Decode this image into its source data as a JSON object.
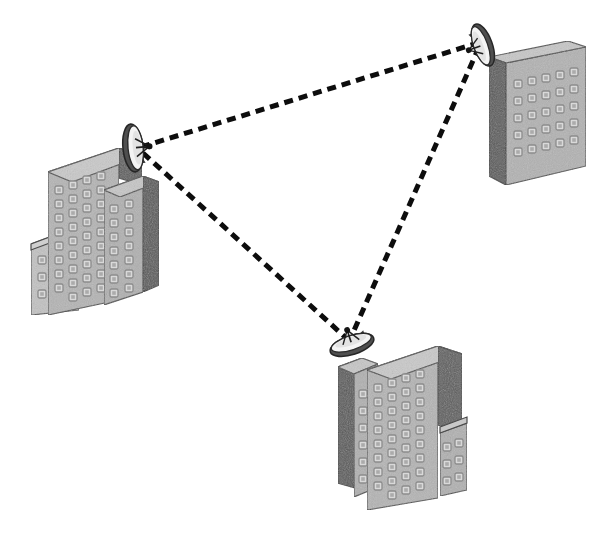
{
  "diagram": {
    "type": "network-topology",
    "background_color": "#ffffff",
    "canvas": {
      "width": 608,
      "height": 537
    }
  },
  "palette": {
    "face_front": "#b0b0b0",
    "face_front_alt": "#a8a8a8",
    "face_side_dark": "#5e5e5e",
    "face_side_dark_alt": "#545454",
    "face_roof": "#c8c8c8",
    "face_roof_alt": "#bdbdbd",
    "window_fill": "#d7d7d7",
    "window_stroke": "#8e8e8e",
    "outline": "#4a4a4a",
    "link_color": "#0d0d0d",
    "dish_face": "#f2f2f2",
    "dish_back": "#4f4f4f",
    "dish_stroke": "#2b2b2b",
    "mast_color": "#3a3a3a"
  },
  "links": {
    "style": "dashed",
    "dash_length": 9,
    "gap_length": 6,
    "stroke_width": 5,
    "items": [
      {
        "id": "link-west-north",
        "label": "West site to North site",
        "from": "node-west",
        "to": "node-north",
        "x1": 141,
        "y1": 147,
        "x2": 481,
        "y2": 42
      },
      {
        "id": "link-west-south",
        "label": "West site to South site",
        "from": "node-west",
        "to": "node-south",
        "x1": 143,
        "y1": 153,
        "x2": 345,
        "y2": 337
      },
      {
        "id": "link-north-south",
        "label": "North site to South site",
        "from": "node-north",
        "to": "node-south",
        "x1": 479,
        "y1": 47,
        "x2": 352,
        "y2": 335
      }
    ]
  },
  "nodes": [
    {
      "id": "node-west",
      "label": "West site",
      "dish_label": "Parabolic antenna facing east",
      "dish": {
        "cx": 133,
        "cy": 148,
        "rx": 10,
        "ry": 24,
        "rotation": -10
      },
      "building_label": "Stepped office tower, west"
    },
    {
      "id": "node-north",
      "label": "North site",
      "dish_label": "Parabolic antenna facing south-west",
      "dish": {
        "cx": 483,
        "cy": 45,
        "rx": 9,
        "ry": 21,
        "rotation": 28
      },
      "building_label": "Rectangular office block, north-east"
    },
    {
      "id": "node-south",
      "label": "South site",
      "dish_label": "Parabolic antenna facing north",
      "dish": {
        "cx": 350,
        "cy": 344,
        "rx": 9,
        "ry": 22,
        "rotation": 24
      },
      "building_label": "Stepped office tower, south"
    }
  ],
  "buildings": {
    "west": {
      "name": "west-building",
      "blocks": [
        {
          "name": "west-low-wing",
          "windows_cols": 2,
          "windows_rows": 3
        },
        {
          "name": "west-main-tower",
          "windows_cols": 4,
          "windows_rows": 9
        },
        {
          "name": "west-right-wing",
          "windows_cols": 2,
          "windows_rows": 7
        }
      ]
    },
    "north": {
      "name": "north-building",
      "blocks": [
        {
          "name": "north-block",
          "windows_cols": 5,
          "windows_rows": 5
        }
      ]
    },
    "south": {
      "name": "south-building",
      "blocks": [
        {
          "name": "south-left-wing",
          "windows_cols": 2,
          "windows_rows": 7
        },
        {
          "name": "south-main-tower",
          "windows_cols": 4,
          "windows_rows": 9
        },
        {
          "name": "south-low-wing",
          "windows_cols": 2,
          "windows_rows": 3
        }
      ]
    }
  }
}
